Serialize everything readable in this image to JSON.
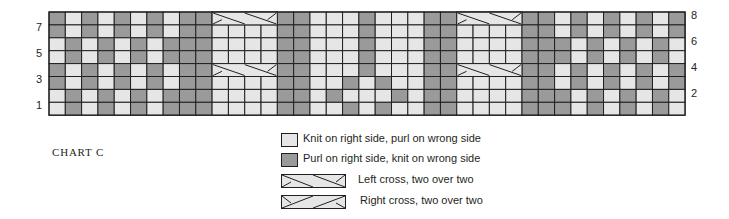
{
  "title": "CHART C",
  "colors": {
    "knit": "#e6e6e6",
    "purl": "#9a9a9a",
    "grid_line": "#231f20"
  },
  "grid": {
    "columns": 39,
    "rows": 8,
    "left": 49,
    "top": 12,
    "cell_width": 16.31,
    "cell_height": 12.9
  },
  "row_labels_left": [
    "7",
    "5",
    "3",
    "1"
  ],
  "row_labels_right": [
    "8",
    "6",
    "4",
    "2"
  ],
  "column_key": {
    "A": "purl,purl,knit,knit,purl,purl,knit,knit",
    "B": "knit,knit,purl,purl,knit,knit,purl,purl",
    "P": "purl all rows",
    "K": "knit all rows",
    "C": "cable column (knit, cross on rows 8 and 4)"
  },
  "rows_top_to_bottom": [
    {
      "row": 8,
      "cells": "PKPKPKPKPP CCCC PP KKKPKKK PP CCCC PP KPKPKPKP"
    },
    {
      "row": 7,
      "cells": "PKPKPKPKPP KKKK PP KKKPKKK PP KKKK PP KPKPKPKP"
    },
    {
      "row": 6,
      "cells": "KPKPKPKPPP KKKK PP KKKPKKK PP KKKK PP PKPKPKPK"
    },
    {
      "row": 5,
      "cells": "KPKPKPKPPP KKKK PP KKKPKKK PP KKKK PP PKPKPKPK"
    },
    {
      "row": 4,
      "cells": "PKPKPKPKPP CCCC PP KKKPKKK PP CCCC PP KPKPKPKP"
    },
    {
      "row": 3,
      "cells": "PKPKPKPKPP KKKK PP KKPKPKK PP KKKK PP KPKPKPKP"
    },
    {
      "row": 2,
      "cells": "KPKPKPKPPP KKKK PP KPKKKPK PP KKKK PP PKPKPKPK"
    },
    {
      "row": 1,
      "cells": "KPKPKPKPPP KKKK PP KKPKPKK PP KKKK PP PKPKPKPK"
    }
  ],
  "cables": [
    {
      "name": "left-cable",
      "start_col": 11,
      "width": 4,
      "cross_rows": [
        8,
        4
      ]
    },
    {
      "name": "right-cable",
      "start_col": 26,
      "width": 4,
      "cross_rows": [
        8,
        4
      ]
    }
  ],
  "legend": [
    {
      "symbol": "knit",
      "label": "Knit on right side, purl on wrong side"
    },
    {
      "symbol": "purl",
      "label": "Purl on right side, knit on wrong side"
    },
    {
      "symbol": "left-cross",
      "label": "Left cross, two over two"
    },
    {
      "symbol": "right-cross",
      "label": "Right cross, two over two"
    }
  ]
}
